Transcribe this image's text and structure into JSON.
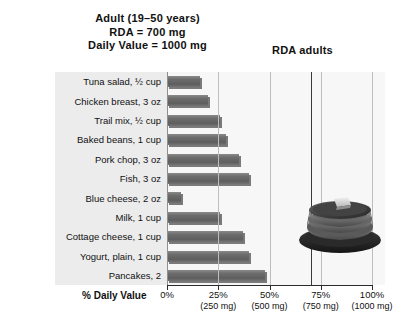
{
  "title": {
    "line1": "Adult (19–50 years)",
    "line2": "RDA = 700 mg",
    "line3": "Daily Value = 1000 mg"
  },
  "annotations": {
    "rda_label": "RDA adults"
  },
  "axis": {
    "title": "% Daily Value",
    "ticks": [
      {
        "percent": "0%",
        "mg": ""
      },
      {
        "percent": "25%",
        "mg": "(250 mg)"
      },
      {
        "percent": "50%",
        "mg": "(500 mg)"
      },
      {
        "percent": "75%",
        "mg": "(750 mg)"
      },
      {
        "percent": "100%",
        "mg": "(1000 mg)"
      }
    ]
  },
  "photo": {
    "caption": "stack-of-pancakes-with-butter"
  },
  "colors": {
    "bar": "#6d6d6d",
    "bar_shadow": "#141414",
    "plot_background": "#f7f7f7",
    "label_band": "#ececec",
    "gridline": "#bdbdbd",
    "rda_line": "#3a3a3a",
    "axis": "#2b2b2b",
    "text": "#111111"
  },
  "chart_data": {
    "type": "bar",
    "orientation": "horizontal",
    "title": "Adult (19–50 years)  RDA = 700 mg  Daily Value = 1000 mg",
    "xlabel": "% Daily Value",
    "ylabel": "",
    "xlim": [
      0,
      112
    ],
    "xticks": [
      0,
      25,
      50,
      75,
      100
    ],
    "xticklabels": [
      "0%",
      "25%",
      "50%",
      "75%",
      "100%"
    ],
    "xtick_sublabels": [
      "",
      "(250 mg)",
      "(500 mg)",
      "(750 mg)",
      "(1000 mg)"
    ],
    "grid": true,
    "legend": false,
    "annotation_lines": [
      {
        "label": "RDA adults",
        "x": 70
      }
    ],
    "categories": [
      "Tuna salad, ½ cup",
      "Chicken breast, 3 oz",
      "Trail mix, ½ cup",
      "Baked beans, 1 cup",
      "Pork chop, 3 oz",
      "Fish, 3 oz",
      "Blue cheese, 2 oz",
      "Milk, 1 cup",
      "Cottage cheese, 1 cup",
      "Yogurt, plain, 1 cup",
      "Pancakes, 2"
    ],
    "values": [
      16,
      20,
      26,
      29,
      35,
      40,
      7,
      26,
      37,
      40,
      48
    ]
  }
}
